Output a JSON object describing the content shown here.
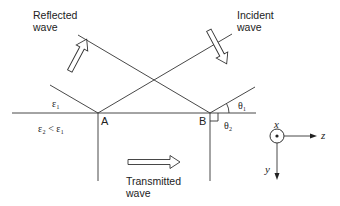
{
  "diagram": {
    "labels": {
      "reflected_wave": "Reflected\nwave",
      "incident_wave": "Incident\nwave",
      "transmitted_wave": "Transmitted\nwave",
      "medium1": "ε₁",
      "medium2": "ε₂ < ε₁",
      "point_a": "A",
      "point_b": "B",
      "theta1": "θ₁",
      "theta2": "θ₂"
    },
    "axes": {
      "x_label": "x",
      "y_label": "y",
      "z_label": "z"
    },
    "colors": {
      "line": "#333333",
      "text": "#222222"
    }
  }
}
